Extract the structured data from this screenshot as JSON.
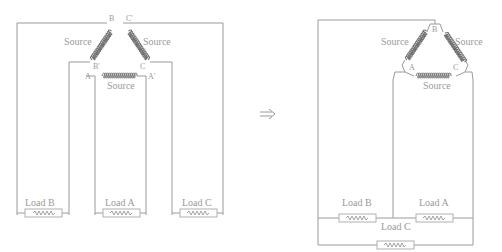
{
  "diagram": {
    "left": {
      "name": "open-wye-delta-before",
      "sources": [
        {
          "label": "Source",
          "position": "upper-left"
        },
        {
          "label": "Source",
          "position": "upper-right"
        },
        {
          "label": "Source",
          "position": "bottom"
        }
      ],
      "terminals": {
        "b": "B",
        "c_prime": "C'",
        "b_prime": "B'",
        "c": "C",
        "a": "A",
        "a_prime": "A'"
      },
      "loads": [
        {
          "label": "Load B"
        },
        {
          "label": "Load A"
        },
        {
          "label": "Load C"
        }
      ]
    },
    "arrow": {
      "symbol": "⟹",
      "meaning": "transforms-to"
    },
    "right": {
      "name": "delta-connection-after",
      "sources": [
        {
          "label": "Source",
          "position": "left"
        },
        {
          "label": "Source",
          "position": "right"
        },
        {
          "label": "Source",
          "position": "bottom"
        }
      ],
      "terminals": {
        "b": "B",
        "a": "A",
        "c": "C"
      },
      "loads": [
        {
          "label": "Load B"
        },
        {
          "label": "Load A"
        },
        {
          "label": "Load C"
        }
      ]
    },
    "colors": {
      "wire": "#9a9a9a",
      "coil": "#6e6e6e",
      "text": "#9a9a9a"
    }
  }
}
